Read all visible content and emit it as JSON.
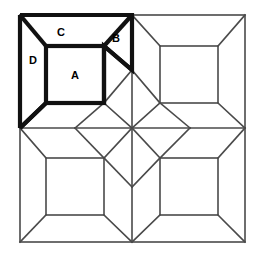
{
  "figure": {
    "type": "line-diagram",
    "background_color": "#ffffff",
    "thin_line_color": "#4a4a4a",
    "bold_line_color": "#111111",
    "outer_square": {
      "left": 20,
      "top": 15,
      "right": 245,
      "bottom": 242
    },
    "center_point": {
      "x": 132,
      "y": 128
    },
    "star_vertices": {
      "left": {
        "x": 75,
        "y": 128
      },
      "right": {
        "x": 190,
        "y": 128
      },
      "top": {
        "x": 132,
        "y": 70
      },
      "bottom": {
        "x": 132,
        "y": 187
      }
    },
    "inner_squares": [
      {
        "name": "top-left",
        "left": 46,
        "top": 46,
        "right": 104,
        "bottom": 103
      },
      {
        "name": "top-right",
        "left": 160,
        "top": 46,
        "right": 218,
        "bottom": 103
      },
      {
        "name": "bottom-left",
        "left": 46,
        "top": 158,
        "right": 104,
        "bottom": 215
      },
      {
        "name": "bottom-right",
        "left": 160,
        "top": 158,
        "right": 218,
        "bottom": 215
      }
    ],
    "labels": [
      {
        "id": "A",
        "text": "A",
        "x": 75,
        "y": 76,
        "piece": "center-square"
      },
      {
        "id": "B",
        "text": "B",
        "x": 116,
        "y": 39,
        "piece": "corner-triangle"
      },
      {
        "id": "C",
        "text": "C",
        "x": 61,
        "y": 33,
        "piece": "top-trapezoid"
      },
      {
        "id": "D",
        "text": "D",
        "x": 33,
        "y": 61,
        "piece": "left-trapezoid"
      }
    ],
    "highlighted_quadrant": "top-left"
  }
}
